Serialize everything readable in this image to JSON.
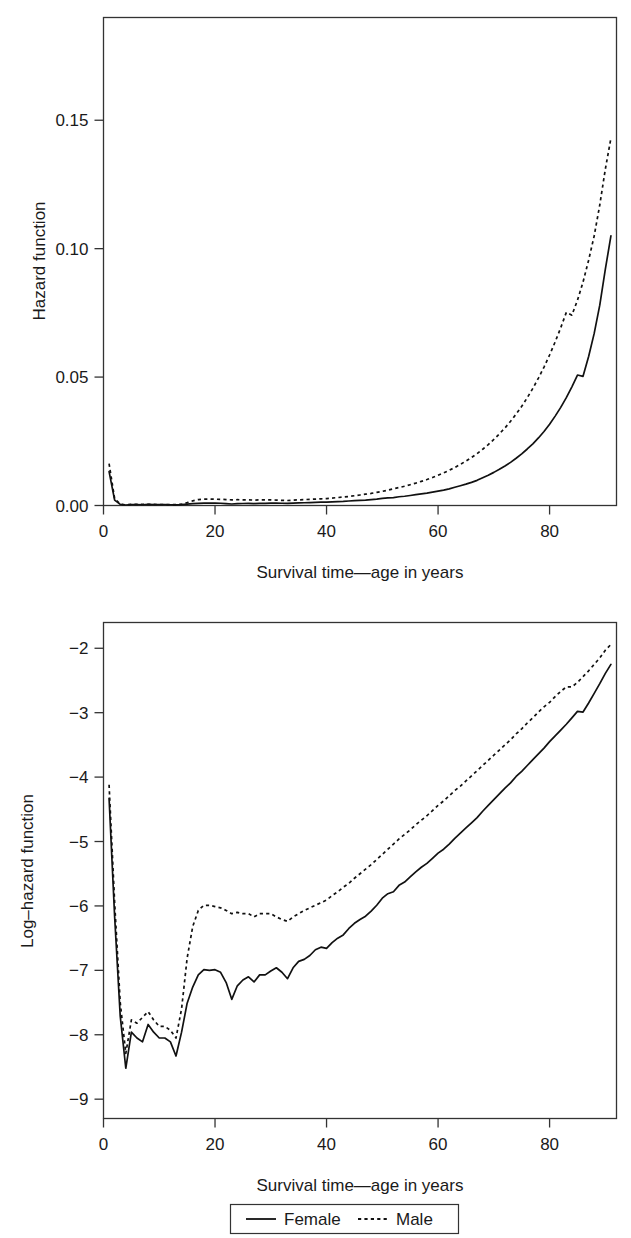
{
  "figure": {
    "panels": [
      {
        "id": "hazard",
        "ylabel": "Hazard function",
        "xlabel": "Survival time—age in years",
        "ytick_labels": [
          "0.00",
          "0.05",
          "0.10",
          "0.15"
        ],
        "xtick_labels": [
          "0",
          "20",
          "40",
          "60",
          "80"
        ]
      },
      {
        "id": "loghazard",
        "ylabel": "Log–hazard function",
        "xlabel": "Survival time—age in years",
        "ytick_labels": [
          "−2",
          "−3",
          "−4",
          "−5",
          "−6",
          "−7",
          "−8",
          "−9"
        ],
        "xtick_labels": [
          "0",
          "20",
          "40",
          "60",
          "80"
        ]
      }
    ],
    "legend": {
      "items": [
        {
          "label": "Female",
          "style": "solid"
        },
        {
          "label": "Male",
          "style": "dotted"
        }
      ]
    },
    "colors": {
      "line": "#111111",
      "frame": "#333333",
      "background": "#ffffff"
    }
  },
  "chart_data": [
    {
      "type": "line",
      "id": "hazard",
      "title": "",
      "xlabel": "Survival time—age in years",
      "ylabel": "Hazard function",
      "xlim": [
        0,
        92
      ],
      "ylim": [
        0.0,
        0.19
      ],
      "xticks": [
        0,
        20,
        40,
        60,
        80
      ],
      "yticks": [
        0.0,
        0.05,
        0.1,
        0.15
      ],
      "grid": false,
      "legend_position": "below-figure",
      "x": [
        1,
        2,
        3,
        4,
        5,
        6,
        7,
        8,
        9,
        10,
        11,
        12,
        13,
        14,
        15,
        16,
        17,
        18,
        19,
        20,
        21,
        22,
        23,
        24,
        25,
        26,
        27,
        28,
        29,
        30,
        31,
        32,
        33,
        34,
        35,
        36,
        37,
        38,
        39,
        40,
        41,
        42,
        43,
        44,
        45,
        46,
        47,
        48,
        49,
        50,
        51,
        52,
        53,
        54,
        55,
        56,
        57,
        58,
        59,
        60,
        61,
        62,
        63,
        64,
        65,
        66,
        67,
        68,
        69,
        70,
        71,
        72,
        73,
        74,
        75,
        76,
        77,
        78,
        79,
        80,
        81,
        82,
        83,
        84,
        85,
        86,
        87,
        88,
        89,
        90,
        91
      ],
      "series": [
        {
          "name": "Female",
          "style": "solid",
          "values": [
            0.0132,
            0.0021,
            0.00045,
            0.0002,
            0.00035,
            0.00032,
            0.0003,
            0.0004,
            0.00035,
            0.00032,
            0.00032,
            0.0003,
            0.00024,
            0.00035,
            0.00055,
            0.0007,
            0.00085,
            0.00092,
            0.00091,
            0.00092,
            0.00088,
            0.00075,
            0.00058,
            0.00072,
            0.00078,
            0.00082,
            0.00076,
            0.00085,
            0.00085,
            0.0009,
            0.00095,
            0.00088,
            0.0008,
            0.00095,
            0.00105,
            0.00108,
            0.00115,
            0.00125,
            0.0013,
            0.00128,
            0.0014,
            0.0015,
            0.00158,
            0.00175,
            0.0019,
            0.002,
            0.0021,
            0.0023,
            0.0025,
            0.0028,
            0.003,
            0.0031,
            0.0034,
            0.0036,
            0.0039,
            0.0042,
            0.0045,
            0.0048,
            0.0052,
            0.0056,
            0.006,
            0.0065,
            0.0071,
            0.0077,
            0.0083,
            0.009,
            0.0098,
            0.0108,
            0.0118,
            0.0129,
            0.0141,
            0.0154,
            0.0168,
            0.0184,
            0.0201,
            0.022,
            0.024,
            0.0263,
            0.0288,
            0.0316,
            0.0348,
            0.0382,
            0.042,
            0.0462,
            0.0508,
            0.0503,
            0.058,
            0.067,
            0.078,
            0.092,
            0.105,
            0.103,
            0.1275,
            0.187
          ]
        },
        {
          "name": "Male",
          "style": "dotted",
          "values": [
            0.0163,
            0.0026,
            0.00055,
            0.00025,
            0.00042,
            0.0004,
            0.00044,
            0.00048,
            0.00042,
            0.00038,
            0.00038,
            0.00036,
            0.00032,
            0.0005,
            0.0011,
            0.0018,
            0.0023,
            0.0025,
            0.0025,
            0.00245,
            0.0024,
            0.0023,
            0.0022,
            0.00225,
            0.0022,
            0.0022,
            0.0021,
            0.0022,
            0.0022,
            0.0022,
            0.0021,
            0.002,
            0.00195,
            0.0021,
            0.0022,
            0.0023,
            0.0024,
            0.0025,
            0.0026,
            0.0027,
            0.0029,
            0.0031,
            0.0033,
            0.0035,
            0.0038,
            0.0041,
            0.0044,
            0.0047,
            0.0051,
            0.0055,
            0.006,
            0.0065,
            0.007,
            0.0075,
            0.0081,
            0.0087,
            0.0094,
            0.0101,
            0.0109,
            0.0118,
            0.0127,
            0.0137,
            0.0148,
            0.016,
            0.0173,
            0.0187,
            0.0202,
            0.0219,
            0.0237,
            0.0257,
            0.0279,
            0.0302,
            0.0328,
            0.0356,
            0.0386,
            0.042,
            0.0456,
            0.0496,
            0.0539,
            0.0586,
            0.0637,
            0.0692,
            0.0752,
            0.0741,
            0.0799,
            0.087,
            0.0955,
            0.105,
            0.117,
            0.131,
            0.143,
            0.162
          ]
        }
      ]
    },
    {
      "type": "line",
      "id": "loghazard",
      "title": "",
      "xlabel": "Survival time—age in years",
      "ylabel": "Log–hazard function",
      "xlim": [
        0,
        92
      ],
      "ylim": [
        -9.3,
        -1.6
      ],
      "xticks": [
        0,
        20,
        40,
        60,
        80
      ],
      "yticks": [
        -2,
        -3,
        -4,
        -5,
        -6,
        -7,
        -8,
        -9
      ],
      "grid": false,
      "legend_position": "below-figure",
      "x": [
        1,
        2,
        3,
        4,
        5,
        6,
        7,
        8,
        9,
        10,
        11,
        12,
        13,
        14,
        15,
        16,
        17,
        18,
        19,
        20,
        21,
        22,
        23,
        24,
        25,
        26,
        27,
        28,
        29,
        30,
        31,
        32,
        33,
        34,
        35,
        36,
        37,
        38,
        39,
        40,
        41,
        42,
        43,
        44,
        45,
        46,
        47,
        48,
        49,
        50,
        51,
        52,
        53,
        54,
        55,
        56,
        57,
        58,
        59,
        60,
        61,
        62,
        63,
        64,
        65,
        66,
        67,
        68,
        69,
        70,
        71,
        72,
        73,
        74,
        75,
        76,
        77,
        78,
        79,
        80,
        81,
        82,
        83,
        84,
        85,
        86,
        87,
        88,
        89,
        90,
        91
      ],
      "series": [
        {
          "name": "Female",
          "style": "solid",
          "values": [
            -4.33,
            -6.17,
            -7.71,
            -8.52,
            -7.96,
            -8.05,
            -8.11,
            -7.84,
            -7.96,
            -8.05,
            -8.05,
            -8.11,
            -8.33,
            -7.96,
            -7.51,
            -7.26,
            -7.07,
            -6.99,
            -7.0,
            -6.99,
            -7.03,
            -7.19,
            -7.45,
            -7.24,
            -7.15,
            -7.1,
            -7.18,
            -7.07,
            -7.07,
            -7.01,
            -6.96,
            -7.03,
            -7.13,
            -6.96,
            -6.86,
            -6.83,
            -6.77,
            -6.68,
            -6.64,
            -6.66,
            -6.57,
            -6.5,
            -6.45,
            -6.35,
            -6.27,
            -6.21,
            -6.16,
            -6.08,
            -5.99,
            -5.88,
            -5.81,
            -5.78,
            -5.68,
            -5.63,
            -5.55,
            -5.47,
            -5.4,
            -5.34,
            -5.26,
            -5.18,
            -5.12,
            -5.04,
            -4.95,
            -4.87,
            -4.79,
            -4.71,
            -4.63,
            -4.53,
            -4.44,
            -4.35,
            -4.26,
            -4.17,
            -4.09,
            -3.99,
            -3.91,
            -3.82,
            -3.73,
            -3.64,
            -3.55,
            -3.45,
            -3.36,
            -3.27,
            -3.18,
            -3.08,
            -2.98,
            -2.99,
            -2.85,
            -2.7,
            -2.55,
            -2.39,
            -2.25,
            -2.27,
            -2.06,
            -1.68
          ]
        },
        {
          "name": "Male",
          "style": "dotted",
          "values": [
            -4.12,
            -5.95,
            -7.5,
            -8.29,
            -7.77,
            -7.82,
            -7.73,
            -7.64,
            -7.77,
            -7.87,
            -7.87,
            -7.93,
            -8.05,
            -7.6,
            -6.81,
            -6.32,
            -6.07,
            -5.99,
            -5.99,
            -6.01,
            -6.03,
            -6.07,
            -6.12,
            -6.1,
            -6.12,
            -6.12,
            -6.17,
            -6.12,
            -6.12,
            -6.12,
            -6.17,
            -6.21,
            -6.24,
            -6.17,
            -6.12,
            -6.07,
            -6.03,
            -5.99,
            -5.95,
            -5.91,
            -5.84,
            -5.78,
            -5.71,
            -5.65,
            -5.57,
            -5.5,
            -5.43,
            -5.36,
            -5.28,
            -5.2,
            -5.12,
            -5.04,
            -4.96,
            -4.89,
            -4.82,
            -4.74,
            -4.67,
            -4.6,
            -4.52,
            -4.44,
            -4.37,
            -4.29,
            -4.21,
            -4.14,
            -4.06,
            -3.98,
            -3.9,
            -3.82,
            -3.74,
            -3.66,
            -3.58,
            -3.5,
            -3.42,
            -3.33,
            -3.25,
            -3.16,
            -3.08,
            -2.99,
            -2.91,
            -2.84,
            -2.75,
            -2.67,
            -2.6,
            -2.6,
            -2.53,
            -2.44,
            -2.35,
            -2.25,
            -2.15,
            -2.03,
            -1.94,
            -1.75
          ]
        }
      ]
    }
  ]
}
